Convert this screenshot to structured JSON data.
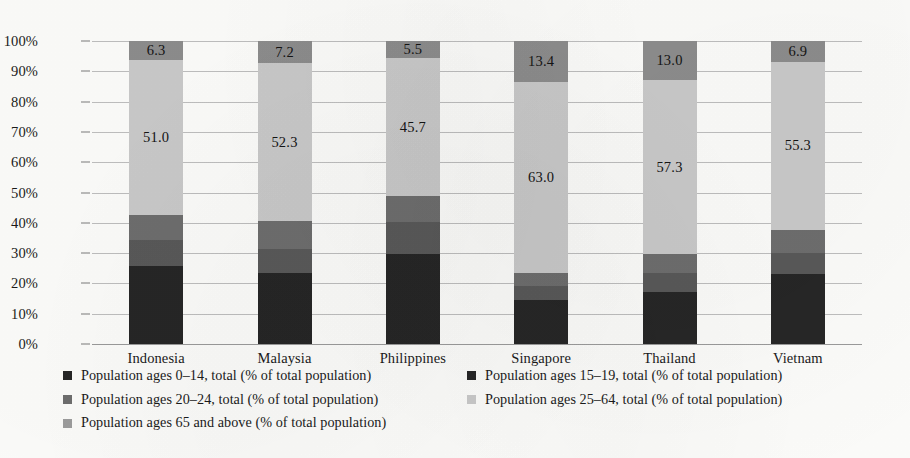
{
  "chart_data": {
    "type": "bar",
    "subtype": "100% stacked column",
    "title": "",
    "subtitle": "",
    "xlabel": "",
    "ylabel": "",
    "ylim": [
      0,
      100
    ],
    "grid": true,
    "legend_position": "bottom",
    "y_ticks": [
      "0%",
      "10%",
      "20%",
      "30%",
      "40%",
      "50%",
      "60%",
      "70%",
      "80%",
      "90%",
      "100%"
    ],
    "y_tick_values": [
      0,
      10,
      20,
      30,
      40,
      50,
      60,
      70,
      80,
      90,
      100
    ],
    "categories": [
      "Indonesia",
      "Malaysia",
      "Philippines",
      "Singapore",
      "Thailand",
      "Vietnam"
    ],
    "series": [
      {
        "name": "Population ages 0–14, total (% of total population)",
        "color": "#262626",
        "values": [
          25.9,
          23.4,
          29.8,
          14.6,
          17.2,
          23.2
        ],
        "labels_shown": false
      },
      {
        "name": "Population ages 15–19, total (% of total population)",
        "color": "#595959",
        "values": [
          8.3,
          8.1,
          10.4,
          4.6,
          6.3,
          6.7
        ],
        "labels_shown": false
      },
      {
        "name": "Population ages 20–24, total (% of total population)",
        "color": "#6e6e6e",
        "values": [
          8.5,
          9.0,
          8.6,
          4.4,
          6.2,
          7.9
        ],
        "labels_shown": false
      },
      {
        "name": "Population ages 25–64, total (% of total population)",
        "color": "#cacaca",
        "values": [
          51.0,
          52.3,
          45.7,
          63.0,
          57.3,
          55.3
        ],
        "labels_shown": true,
        "value_labels": [
          "51.0",
          "52.3",
          "45.7",
          "63.0",
          "57.3",
          "55.3"
        ]
      },
      {
        "name": "Population ages 65 and above (% of total population)",
        "color": "#8d8d8d",
        "values": [
          6.3,
          7.2,
          5.5,
          13.4,
          13.0,
          6.9
        ],
        "labels_shown": true,
        "value_labels": [
          "6.3",
          "7.2",
          "5.5",
          "13.4",
          "13.0",
          "6.9"
        ]
      }
    ]
  },
  "legend": {
    "items": [
      {
        "label": "Population ages 0–14, total (% of total population)",
        "color": "#262626"
      },
      {
        "label": "Population ages 15–19, total (% of total population)",
        "color": "#262626"
      },
      {
        "label": "Population ages 20–24, total (% of total population)",
        "color": "#6e6e6e"
      },
      {
        "label": "Population ages 25–64, total (% of total population)",
        "color": "#cacaca"
      },
      {
        "label": "Population ages 65 and above (% of total population)",
        "color": "#9d9d9d"
      }
    ]
  }
}
